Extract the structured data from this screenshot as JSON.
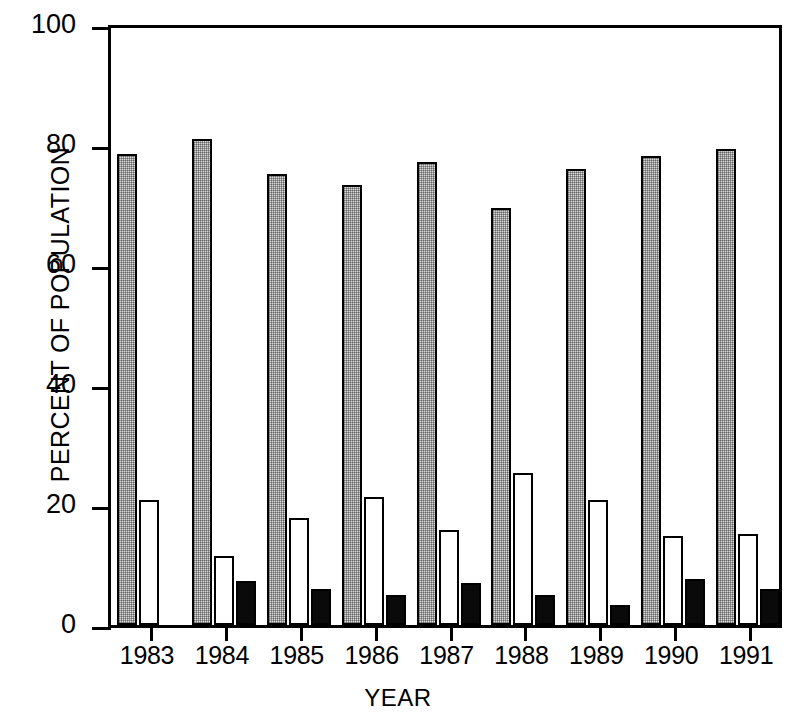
{
  "chart_data": {
    "type": "bar",
    "title": "",
    "annotation": "Age profile",
    "xlabel": "YEAR",
    "ylabel": "PERCENT OF POPULATION",
    "ylim": [
      0,
      100
    ],
    "yticks": [
      0,
      20,
      40,
      60,
      80,
      100
    ],
    "ytick_labels": [
      "0",
      "20",
      "40",
      "60",
      "80",
      "100"
    ],
    "grid": false,
    "legend_position": "top-center",
    "categories": [
      "1983",
      "1984",
      "1985",
      "1986",
      "1987",
      "1988",
      "1989",
      "1990",
      "1991"
    ],
    "series": [
      {
        "name": "adult",
        "color": "#d8d8d8",
        "fill": "stippled-gray",
        "values": [
          78.5,
          81.0,
          75.2,
          73.3,
          77.2,
          69.5,
          76.0,
          78.2,
          79.3
        ]
      },
      {
        "name": "subadult",
        "color": "#ffffff",
        "fill": "white",
        "values": [
          20.8,
          11.5,
          17.8,
          21.4,
          15.8,
          25.4,
          20.9,
          14.8,
          15.2
        ]
      },
      {
        "name": "juvenile",
        "color": "#000000",
        "fill": "black",
        "values": [
          0,
          7.4,
          6.0,
          5.0,
          7.0,
          5.0,
          3.3,
          7.6,
          6.0
        ]
      }
    ]
  },
  "legend": {
    "items": [
      {
        "label": "adult",
        "swatch": "adult"
      },
      {
        "label": "subadult",
        "swatch": "subadult"
      },
      {
        "label": "juvenile",
        "swatch": "juvenile"
      }
    ]
  }
}
